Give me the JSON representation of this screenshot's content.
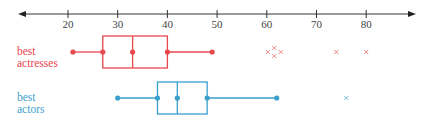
{
  "chart_data": {
    "type": "boxplot",
    "title": "",
    "xlabel": "",
    "ylabel": "",
    "axis": {
      "ticks": [
        20,
        30,
        40,
        50,
        60,
        70,
        80
      ],
      "range": [
        10,
        88
      ],
      "arrows": "both"
    },
    "grid": false,
    "series": [
      {
        "name": "best actresses",
        "label_lines": [
          "best",
          "actresses"
        ],
        "color": "#e8474c",
        "min": 21,
        "q1": 27,
        "median": 33,
        "q3": 40,
        "max": 49,
        "outliers": [
          61,
          61.5,
          61.5,
          62,
          74,
          80
        ]
      },
      {
        "name": "best actors",
        "label_lines": [
          "best",
          "actors"
        ],
        "color": "#3b9fcc",
        "min": 30,
        "q1": 38,
        "median": 42,
        "q3": 48,
        "max": 62,
        "outliers": [
          76
        ]
      }
    ]
  },
  "labels": {
    "actresses_line1": "best",
    "actresses_line2": "actresses",
    "actors_line1": "best",
    "actors_line2": "actors"
  }
}
